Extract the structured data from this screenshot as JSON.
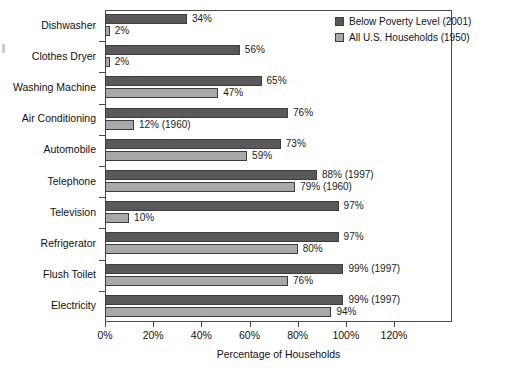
{
  "chart_data": {
    "type": "bar",
    "orientation": "horizontal",
    "title": "",
    "xlabel": "Percentage of Households",
    "ylabel": "",
    "xlim": [
      0,
      120
    ],
    "xticks": [
      "0%",
      "20%",
      "40%",
      "60%",
      "80%",
      "100%",
      "120%"
    ],
    "xtick_values": [
      0,
      20,
      40,
      60,
      80,
      100,
      120
    ],
    "grid": false,
    "legend_position": "top-right",
    "categories": [
      "Dishwasher",
      "Clothes Dryer",
      "Washing Machine",
      "Air Conditioning",
      "Automobile",
      "Telephone",
      "Television",
      "Refrigerator",
      "Flush Toilet",
      "Electricity"
    ],
    "series": [
      {
        "name": "Below Poverty Level (2001)",
        "color": "#595959",
        "values": [
          34,
          56,
          65,
          76,
          73,
          88,
          97,
          97,
          99,
          99
        ],
        "labels": [
          "34%",
          "56%",
          "65%",
          "76%",
          "73%",
          "88% (1997)",
          "97%",
          "97%",
          "99% (1997)",
          "99% (1997)"
        ]
      },
      {
        "name": "All U.S. Households (1950)",
        "color": "#a8a8a8",
        "values": [
          2,
          2,
          47,
          12,
          59,
          79,
          10,
          80,
          76,
          94
        ],
        "labels": [
          "2%",
          "2%",
          "47%",
          "12% (1960)",
          "59%",
          "79% (1960)",
          "10%",
          "80%",
          "76%",
          "94%"
        ]
      }
    ]
  },
  "legend": {
    "items": [
      {
        "label": "Below Poverty Level (2001)",
        "color": "#595959"
      },
      {
        "label": "All U.S. Households (1950)",
        "color": "#a8a8a8"
      }
    ]
  },
  "axis": {
    "x_title": "Percentage of Households"
  }
}
